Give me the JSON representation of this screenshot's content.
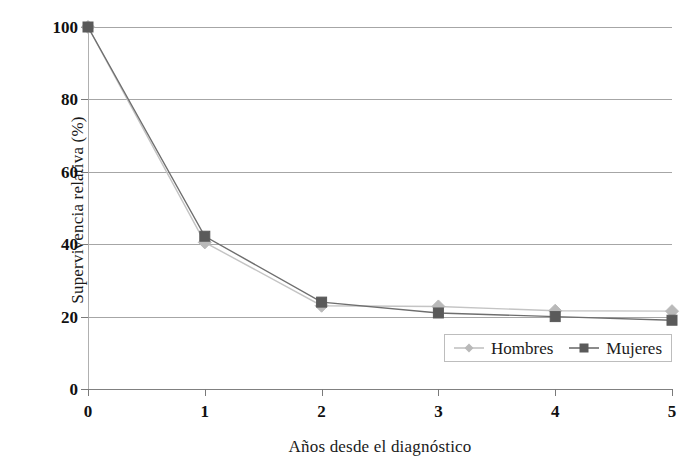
{
  "chart_data": {
    "type": "line",
    "title": "",
    "xlabel": "Años desde el diagnóstico",
    "ylabel": "Supervivencia relativa (%)",
    "x": [
      0,
      1,
      2,
      3,
      4,
      5
    ],
    "x_tick_labels": [
      "0",
      "1",
      "2",
      "3",
      "4",
      "5"
    ],
    "y_tick_labels": [
      "0",
      "20",
      "40",
      "60",
      "80",
      "100"
    ],
    "y_ticks": [
      0,
      20,
      40,
      60,
      80,
      100
    ],
    "xlim": [
      0,
      5
    ],
    "ylim": [
      0,
      100
    ],
    "grid": "horizontal",
    "legend_position": "inside-bottom-right",
    "series": [
      {
        "name": "Hombres",
        "marker": "diamond",
        "color": "#b9b9b9",
        "line_color": "#c4c4c4",
        "values": [
          100,
          40.5,
          23,
          22.8,
          21.6,
          21.5
        ]
      },
      {
        "name": "Mujeres",
        "marker": "square",
        "color": "#5a5a5a",
        "line_color": "#6e6e6e",
        "values": [
          100,
          42.2,
          24,
          21,
          20,
          19
        ]
      }
    ]
  },
  "axes": {
    "y_title": "Supervivencia relativa (%)",
    "x_title": "Años desde el diagnóstico",
    "y_tick_labels": [
      "100",
      "80",
      "60",
      "40",
      "20",
      "0"
    ],
    "x_tick_labels": [
      "0",
      "1",
      "2",
      "3",
      "4",
      "5"
    ]
  },
  "legend": {
    "items": [
      {
        "label": "Hombres",
        "marker": "diamond-marker",
        "color": "#b9b9b9"
      },
      {
        "label": "Mujeres",
        "marker": "square-marker",
        "color": "#5a5a5a"
      }
    ]
  },
  "colors": {
    "gridline": "#a6a6a6",
    "axis": "#808080",
    "series_light": "#b9b9b9",
    "series_dark": "#5a5a5a",
    "background": "#ffffff",
    "text": "#1a1a1a"
  }
}
